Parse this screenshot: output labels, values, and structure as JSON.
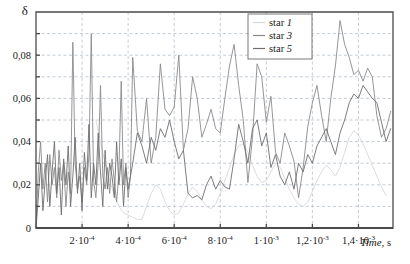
{
  "chart_data": {
    "type": "line",
    "title": "",
    "xlabel": "Time, s",
    "ylabel": "δ",
    "xlim": [
      0,
      0.00155
    ],
    "ylim": [
      0,
      0.1
    ],
    "grid": true,
    "legend_position": "top-right",
    "x_tick_labels": [
      "2·10",
      "4·10",
      "6·10",
      "8·10",
      "1·10",
      "1,2·10",
      "1,4·10"
    ],
    "x_tick_exponents": [
      "-4",
      "-4",
      "-4",
      "-4",
      "-3",
      "-3",
      "-3"
    ],
    "x_tick_values": [
      0.0002,
      0.0004,
      0.0006,
      0.0008,
      0.001,
      0.0012,
      0.0014
    ],
    "y_tick_labels": [
      "0",
      "0,02",
      "0,04",
      "0,06",
      "0,08"
    ],
    "y_tick_values": [
      0,
      0.02,
      0.04,
      0.06,
      0.08
    ],
    "y_minor_values": [
      0.01,
      0.03,
      0.05,
      0.07,
      0.09
    ],
    "colors": {
      "star1": "#d8d8d8",
      "star3": "#8a8a8a",
      "star5": "#6e6e6e",
      "grid": "#a9b6c6",
      "axis": "#4a4a4a"
    },
    "series": [
      {
        "name": "star 1",
        "name_prefix": "star ",
        "name_index": "1",
        "color_key": "star1",
        "x": [
          0.00026,
          0.00028,
          0.0003,
          0.00032,
          0.00034,
          0.00036,
          0.00038,
          0.0004,
          0.00042,
          0.00044,
          0.00046,
          0.00048,
          0.0005,
          0.00052,
          0.00054,
          0.00056,
          0.00058,
          0.0006,
          0.00062,
          0.00064,
          0.00066,
          0.00068,
          0.0007,
          0.00072,
          0.00074,
          0.00076,
          0.00078,
          0.0008,
          0.00082,
          0.00084,
          0.00086,
          0.00088,
          0.0009,
          0.00092,
          0.00094,
          0.00096,
          0.00098,
          0.001,
          0.00102,
          0.00104,
          0.00106,
          0.00108,
          0.0011,
          0.00112,
          0.00114,
          0.00116,
          0.00118,
          0.0012,
          0.00122,
          0.00124,
          0.00126,
          0.00128,
          0.0013,
          0.00132,
          0.00134,
          0.00136,
          0.00138,
          0.0014,
          0.00142,
          0.00144,
          0.00146,
          0.00148,
          0.0015,
          0.00152
        ],
        "y": [
          0.05,
          0.04,
          0.03,
          0.022,
          0.015,
          0.01,
          0.007,
          0.006,
          0.005,
          0.004,
          0.004,
          0.01,
          0.016,
          0.02,
          0.018,
          0.012,
          0.008,
          0.006,
          0.007,
          0.011,
          0.016,
          0.019,
          0.017,
          0.013,
          0.01,
          0.009,
          0.011,
          0.016,
          0.022,
          0.028,
          0.034,
          0.038,
          0.039,
          0.035,
          0.029,
          0.024,
          0.021,
          0.022,
          0.026,
          0.03,
          0.028,
          0.023,
          0.018,
          0.014,
          0.011,
          0.01,
          0.012,
          0.017,
          0.022,
          0.026,
          0.029,
          0.027,
          0.024,
          0.028,
          0.035,
          0.042,
          0.045,
          0.043,
          0.039,
          0.034,
          0.029,
          0.024,
          0.019,
          0.015
        ]
      },
      {
        "name": "star 3",
        "name_prefix": "star ",
        "name_index": "3",
        "color_key": "star3",
        "x": [
          0.0,
          1e-05,
          2e-05,
          3e-05,
          4e-05,
          5e-05,
          6e-05,
          7e-05,
          8e-05,
          9e-05,
          0.0001,
          0.00011,
          0.00012,
          0.00013,
          0.00014,
          0.00015,
          0.00016,
          0.00017,
          0.00018,
          0.00019,
          0.0002,
          0.00021,
          0.00022,
          0.00023,
          0.00024,
          0.00025,
          0.00026,
          0.00027,
          0.00028,
          0.00029,
          0.0003,
          0.00031,
          0.00032,
          0.00033,
          0.00034,
          0.00035,
          0.00036,
          0.00037,
          0.00038,
          0.00039,
          0.0004,
          0.00041,
          0.00042,
          0.00044,
          0.00046,
          0.00048,
          0.0005,
          0.00052,
          0.00054,
          0.00056,
          0.00058,
          0.0006,
          0.00062,
          0.00064,
          0.00066,
          0.00068,
          0.0007,
          0.00072,
          0.00074,
          0.00076,
          0.00078,
          0.0008,
          0.00082,
          0.00084,
          0.00086,
          0.00088,
          0.0009,
          0.00092,
          0.00094,
          0.00096,
          0.00098,
          0.001,
          0.00102,
          0.00104,
          0.00106,
          0.00108,
          0.0011,
          0.00112,
          0.00114,
          0.00116,
          0.00118,
          0.0012,
          0.00122,
          0.00124,
          0.00126,
          0.00128,
          0.0013,
          0.00132,
          0.00134,
          0.00136,
          0.00138,
          0.0014,
          0.00142,
          0.00144,
          0.00146,
          0.00148,
          0.0015,
          0.00152,
          0.00154
        ],
        "y": [
          0.0,
          0.026,
          0.04,
          0.018,
          0.03,
          0.012,
          0.034,
          0.02,
          0.028,
          0.014,
          0.036,
          0.022,
          0.03,
          0.01,
          0.026,
          0.016,
          0.086,
          0.03,
          0.018,
          0.024,
          0.012,
          0.028,
          0.02,
          0.034,
          0.09,
          0.022,
          0.014,
          0.03,
          0.066,
          0.024,
          0.018,
          0.028,
          0.016,
          0.032,
          0.022,
          0.012,
          0.026,
          0.068,
          0.02,
          0.03,
          0.014,
          0.024,
          0.079,
          0.045,
          0.04,
          0.06,
          0.03,
          0.042,
          0.076,
          0.055,
          0.052,
          0.056,
          0.08,
          0.036,
          0.046,
          0.07,
          0.06,
          0.042,
          0.048,
          0.055,
          0.046,
          0.044,
          0.06,
          0.075,
          0.085,
          0.066,
          0.05,
          0.021,
          0.042,
          0.076,
          0.07,
          0.049,
          0.061,
          0.035,
          0.03,
          0.044,
          0.038,
          0.031,
          0.014,
          0.028,
          0.047,
          0.058,
          0.066,
          0.052,
          0.04,
          0.06,
          0.075,
          0.096,
          0.085,
          0.079,
          0.071,
          0.073,
          0.068,
          0.074,
          0.07,
          0.052,
          0.042,
          0.046,
          0.054
        ]
      },
      {
        "name": "star 5",
        "name_prefix": "star ",
        "name_index": "5",
        "color_key": "star5",
        "x": [
          0.0,
          1e-05,
          2e-05,
          3e-05,
          4e-05,
          5e-05,
          6e-05,
          7e-05,
          8e-05,
          9e-05,
          0.0001,
          0.00011,
          0.00012,
          0.00013,
          0.00014,
          0.00015,
          0.00016,
          0.00017,
          0.00018,
          0.00019,
          0.0002,
          0.00021,
          0.00022,
          0.00023,
          0.00024,
          0.00025,
          0.00026,
          0.00027,
          0.00028,
          0.00029,
          0.0003,
          0.00031,
          0.00032,
          0.00033,
          0.00034,
          0.00035,
          0.00036,
          0.00037,
          0.00038,
          0.00039,
          0.0004,
          0.00042,
          0.00044,
          0.00046,
          0.00048,
          0.0005,
          0.00052,
          0.00054,
          0.00056,
          0.00058,
          0.0006,
          0.00062,
          0.00064,
          0.00066,
          0.00068,
          0.0007,
          0.00072,
          0.00074,
          0.00076,
          0.00078,
          0.0008,
          0.00082,
          0.00084,
          0.00086,
          0.00088,
          0.0009,
          0.00092,
          0.00094,
          0.00096,
          0.00098,
          0.001,
          0.00102,
          0.00104,
          0.00106,
          0.00108,
          0.0011,
          0.00112,
          0.00114,
          0.00116,
          0.00118,
          0.0012,
          0.00122,
          0.00124,
          0.00126,
          0.00128,
          0.0013,
          0.00132,
          0.00134,
          0.00136,
          0.00138,
          0.0014,
          0.00142,
          0.00144,
          0.00146,
          0.00148,
          0.0015,
          0.00152,
          0.00154
        ],
        "y": [
          0.0,
          0.014,
          0.03,
          0.008,
          0.022,
          0.034,
          0.01,
          0.026,
          0.04,
          0.016,
          0.028,
          0.006,
          0.032,
          0.02,
          0.038,
          0.01,
          0.024,
          0.042,
          0.016,
          0.03,
          0.008,
          0.035,
          0.022,
          0.048,
          0.014,
          0.03,
          0.02,
          0.044,
          0.026,
          0.01,
          0.036,
          0.018,
          0.03,
          0.024,
          0.014,
          0.04,
          0.02,
          0.032,
          0.01,
          0.028,
          0.018,
          0.03,
          0.044,
          0.038,
          0.03,
          0.042,
          0.036,
          0.046,
          0.042,
          0.05,
          0.04,
          0.032,
          0.036,
          0.016,
          0.014,
          0.015,
          0.013,
          0.02,
          0.024,
          0.018,
          0.022,
          0.019,
          0.018,
          0.032,
          0.048,
          0.04,
          0.03,
          0.046,
          0.05,
          0.038,
          0.044,
          0.028,
          0.034,
          0.024,
          0.02,
          0.026,
          0.018,
          0.03,
          0.026,
          0.034,
          0.03,
          0.038,
          0.042,
          0.046,
          0.04,
          0.034,
          0.044,
          0.05,
          0.058,
          0.062,
          0.06,
          0.066,
          0.063,
          0.06,
          0.058,
          0.049,
          0.04,
          0.046
        ]
      }
    ]
  },
  "legend": {
    "items": [
      {
        "label_prefix": "star ",
        "label_index": "1"
      },
      {
        "label_prefix": "star ",
        "label_index": "3"
      },
      {
        "label_prefix": "star ",
        "label_index": "5"
      }
    ]
  }
}
